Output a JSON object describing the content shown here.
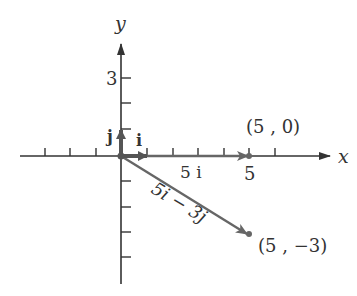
{
  "axes": {
    "x_label": "x",
    "y_label": "y",
    "y_tick_label": "3",
    "x_tick_label": "5"
  },
  "unit_vectors": {
    "i_label": "i",
    "j_label": "j"
  },
  "vectors": [
    {
      "label": "5 i",
      "from": [
        0,
        0
      ],
      "to": [
        5,
        0
      ]
    },
    {
      "label": "5i − 3j",
      "from": [
        0,
        0
      ],
      "to": [
        5,
        -3
      ]
    }
  ],
  "points": [
    {
      "label": "(5 , 0)",
      "x": 5,
      "y": 0
    },
    {
      "label": "(5 , −3)",
      "x": 5,
      "y": -3
    }
  ],
  "colors": {
    "axis": "#333333",
    "vector": "#666666"
  }
}
